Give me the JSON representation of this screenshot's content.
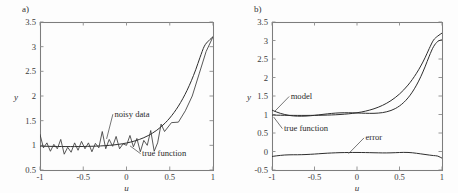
{
  "figure": {
    "background": "#fdfdfd",
    "ink_color": "#2e2e2e",
    "axis_color": "#7d7d7d",
    "panels": [
      {
        "label": "a)"
      },
      {
        "label": "b)"
      }
    ]
  },
  "chart_data": [
    {
      "id": "panel-a",
      "type": "line",
      "title": "a)",
      "xlabel": "u",
      "ylabel": "y",
      "xlim": [
        -1,
        1
      ],
      "ylim": [
        0.5,
        3.5
      ],
      "xticks": [
        -1,
        -0.5,
        0,
        0.5,
        1
      ],
      "xticklabels": [
        "-1",
        "-0.5",
        "0",
        "0.5",
        "1"
      ],
      "yticks": [
        0.5,
        1,
        1.5,
        2,
        2.5,
        3,
        3.5
      ],
      "yticklabels": [
        "0.5",
        "1",
        "1.5",
        "2",
        "2.5",
        "3",
        "3.5"
      ],
      "grid": false,
      "legend": "none",
      "annotations": [
        {
          "text": "noisy data",
          "x": -0.14,
          "y": 1.58,
          "anchor": "start",
          "leader_to": {
            "x": -0.23,
            "y": 1.13
          }
        },
        {
          "text": "true function",
          "x": 0.18,
          "y": 0.78,
          "anchor": "start",
          "leader_to": {
            "x": 0.04,
            "y": 0.99
          }
        }
      ],
      "series": [
        {
          "name": "true function",
          "style": "smooth",
          "x": [
            -1.0,
            -0.95,
            -0.9,
            -0.85,
            -0.8,
            -0.75,
            -0.7,
            -0.65,
            -0.6,
            -0.55,
            -0.5,
            -0.45,
            -0.4,
            -0.35,
            -0.3,
            -0.25,
            -0.2,
            -0.15,
            -0.1,
            -0.05,
            0.0,
            0.05,
            0.1,
            0.15,
            0.2,
            0.25,
            0.3,
            0.35,
            0.4,
            0.45,
            0.5,
            0.55,
            0.6,
            0.65,
            0.7,
            0.75,
            0.8,
            0.85,
            0.9,
            0.95,
            1.0
          ],
          "values": [
            0.985,
            0.982,
            0.98,
            0.978,
            0.977,
            0.976,
            0.975,
            0.975,
            0.975,
            0.976,
            0.977,
            0.979,
            0.981,
            0.984,
            0.988,
            0.993,
            1.0,
            1.008,
            1.018,
            1.031,
            1.047,
            1.067,
            1.091,
            1.12,
            1.155,
            1.197,
            1.247,
            1.306,
            1.376,
            1.458,
            1.554,
            1.666,
            1.795,
            1.944,
            2.115,
            2.31,
            2.532,
            2.783,
            3.01,
            3.12,
            3.2
          ]
        },
        {
          "name": "noisy data",
          "style": "zigzag",
          "x": [
            -1.0,
            -0.96,
            -0.92,
            -0.88,
            -0.84,
            -0.8,
            -0.76,
            -0.72,
            -0.68,
            -0.64,
            -0.6,
            -0.56,
            -0.52,
            -0.48,
            -0.44,
            -0.4,
            -0.36,
            -0.32,
            -0.28,
            -0.24,
            -0.2,
            -0.16,
            -0.12,
            -0.08,
            -0.04,
            0.0,
            0.04,
            0.08,
            0.12,
            0.16,
            0.2,
            0.24,
            0.28,
            0.32,
            0.36,
            0.4,
            0.44,
            0.52,
            0.6,
            0.68,
            0.76,
            0.84,
            0.92,
            1.0
          ],
          "values": [
            1.22,
            0.95,
            1.05,
            0.88,
            1.02,
            0.93,
            1.12,
            0.82,
            0.96,
            0.86,
            1.05,
            0.9,
            1.08,
            0.93,
            1.05,
            0.87,
            1.04,
            0.95,
            1.28,
            0.93,
            1.12,
            0.98,
            1.18,
            0.93,
            1.03,
            1.0,
            1.2,
            0.97,
            1.14,
            0.87,
            1.1,
            1.0,
            1.3,
            0.88,
            1.05,
            1.43,
            1.28,
            1.46,
            1.47,
            1.7,
            2.0,
            2.45,
            2.9,
            3.2
          ]
        }
      ]
    },
    {
      "id": "panel-b",
      "type": "line",
      "title": "b)",
      "xlabel": "u",
      "ylabel": "y",
      "xlim": [
        -1,
        1
      ],
      "ylim": [
        -0.5,
        3.5
      ],
      "xticks": [
        -1,
        -0.5,
        0,
        0.5,
        1
      ],
      "xticklabels": [
        "-1",
        "-0.5",
        "0",
        "0.5",
        "1"
      ],
      "yticks": [
        -0.5,
        0,
        0.5,
        1,
        1.5,
        2,
        2.5,
        3,
        3.5
      ],
      "yticklabels": [
        "-0.5",
        "0",
        "0.5",
        "1",
        "1.5",
        "2",
        "2.5",
        "3",
        "3.5"
      ],
      "grid": false,
      "legend": "none",
      "annotations": [
        {
          "text": "model",
          "x": -0.78,
          "y": 1.42,
          "anchor": "start",
          "leader_to": {
            "x": -0.97,
            "y": 1.08
          }
        },
        {
          "text": "true function",
          "x": -0.86,
          "y": 0.55,
          "anchor": "start",
          "leader_to": {
            "x": -0.98,
            "y": 0.93
          }
        },
        {
          "text": "error",
          "x": 0.1,
          "y": 0.3,
          "anchor": "start",
          "leader_to": {
            "x": -0.1,
            "y": -0.06
          }
        }
      ],
      "series": [
        {
          "name": "model",
          "style": "smooth",
          "x": [
            -1.0,
            -0.95,
            -0.9,
            -0.85,
            -0.8,
            -0.75,
            -0.7,
            -0.65,
            -0.6,
            -0.55,
            -0.5,
            -0.45,
            -0.4,
            -0.35,
            -0.3,
            -0.25,
            -0.2,
            -0.15,
            -0.1,
            -0.05,
            0.0,
            0.05,
            0.1,
            0.15,
            0.2,
            0.25,
            0.3,
            0.35,
            0.4,
            0.45,
            0.5,
            0.55,
            0.6,
            0.65,
            0.7,
            0.75,
            0.8,
            0.85,
            0.9,
            0.95,
            1.0
          ],
          "values": [
            1.12,
            1.07,
            1.03,
            1.0,
            0.975,
            0.962,
            0.955,
            0.954,
            0.958,
            0.966,
            0.977,
            0.99,
            1.004,
            1.017,
            1.029,
            1.038,
            1.044,
            1.047,
            1.047,
            1.045,
            1.041,
            1.037,
            1.033,
            1.031,
            1.032,
            1.038,
            1.051,
            1.074,
            1.109,
            1.16,
            1.231,
            1.326,
            1.449,
            1.604,
            1.794,
            2.021,
            2.286,
            2.578,
            2.832,
            2.975,
            3.02
          ]
        },
        {
          "name": "true function",
          "style": "smooth",
          "x": [
            -1.0,
            -0.95,
            -0.9,
            -0.85,
            -0.8,
            -0.75,
            -0.7,
            -0.65,
            -0.6,
            -0.55,
            -0.5,
            -0.45,
            -0.4,
            -0.35,
            -0.3,
            -0.25,
            -0.2,
            -0.15,
            -0.1,
            -0.05,
            0.0,
            0.05,
            0.1,
            0.15,
            0.2,
            0.25,
            0.3,
            0.35,
            0.4,
            0.45,
            0.5,
            0.55,
            0.6,
            0.65,
            0.7,
            0.75,
            0.8,
            0.85,
            0.9,
            0.95,
            1.0
          ],
          "values": [
            0.985,
            0.982,
            0.98,
            0.978,
            0.977,
            0.976,
            0.975,
            0.975,
            0.975,
            0.976,
            0.977,
            0.979,
            0.981,
            0.984,
            0.988,
            0.993,
            1.0,
            1.008,
            1.018,
            1.031,
            1.047,
            1.067,
            1.091,
            1.12,
            1.155,
            1.197,
            1.247,
            1.306,
            1.376,
            1.458,
            1.554,
            1.666,
            1.795,
            1.944,
            2.115,
            2.31,
            2.532,
            2.783,
            3.01,
            3.12,
            3.2
          ]
        },
        {
          "name": "error",
          "style": "smooth",
          "x": [
            -1.0,
            -0.95,
            -0.9,
            -0.85,
            -0.8,
            -0.75,
            -0.7,
            -0.65,
            -0.6,
            -0.55,
            -0.5,
            -0.45,
            -0.4,
            -0.35,
            -0.3,
            -0.25,
            -0.2,
            -0.15,
            -0.1,
            -0.05,
            0.0,
            0.05,
            0.1,
            0.15,
            0.2,
            0.25,
            0.3,
            0.35,
            0.4,
            0.45,
            0.5,
            0.55,
            0.6,
            0.65,
            0.7,
            0.75,
            0.8,
            0.85,
            0.9,
            0.95,
            1.0
          ],
          "values": [
            -0.135,
            -0.118,
            -0.105,
            -0.095,
            -0.09,
            -0.088,
            -0.088,
            -0.086,
            -0.082,
            -0.076,
            -0.069,
            -0.061,
            -0.053,
            -0.046,
            -0.04,
            -0.035,
            -0.031,
            -0.029,
            -0.027,
            -0.026,
            -0.026,
            -0.027,
            -0.029,
            -0.031,
            -0.034,
            -0.036,
            -0.038,
            -0.038,
            -0.036,
            -0.032,
            -0.027,
            -0.024,
            -0.026,
            -0.034,
            -0.048,
            -0.064,
            -0.08,
            -0.096,
            -0.11,
            -0.124,
            -0.18
          ]
        }
      ]
    }
  ]
}
